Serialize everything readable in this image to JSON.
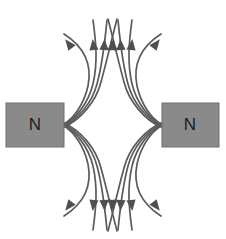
{
  "figure": {
    "width": 226,
    "height": 239,
    "background_color": "#ffffff"
  },
  "magnets": [
    {
      "id": "left-magnet",
      "label": "N",
      "pole": "north",
      "fill_color": "#8a8a8a",
      "stroke_color": "#6f6f6f",
      "label_color": "#1d1d1d",
      "x": 6,
      "y": 103,
      "width": 58,
      "height": 44,
      "label_x": 35,
      "label_y": 126
    },
    {
      "id": "right-magnet",
      "label": "N",
      "pole": "north",
      "fill_color": "#8a8a8a",
      "stroke_color": "#6f6f6f",
      "label_color": "#1d1d1d",
      "x": 162,
      "y": 103,
      "width": 57,
      "height": 44,
      "label_x": 190,
      "label_y": 126
    }
  ],
  "field": {
    "line_color": "#5b5b5b",
    "arrow_color": "#4f4f4f",
    "line_width": 1.7,
    "lines": [
      {
        "id": "L-up-1",
        "side": "left",
        "direction": "up",
        "d": "M 64 124 C 74 118 84 104 88 86 C 92 66 86 48 64 34"
      },
      {
        "id": "L-up-2",
        "side": "left",
        "direction": "up",
        "d": "M 64 125 C 76 118 88 104 93 84 C 98 62 96 42 93 20"
      },
      {
        "id": "L-up-3",
        "side": "left",
        "direction": "up",
        "d": "M 64 126 C 78 119 92 103 97 84 C 103 62 105 40 107 20"
      },
      {
        "id": "L-up-4",
        "side": "left",
        "direction": "up",
        "d": "M 64 127 C 80 120 96 102 101 82 C 107 60 112 38 117 19"
      },
      {
        "id": "L-dn-1",
        "side": "left",
        "direction": "down",
        "d": "M 64 126 C 74 132 84 146 88 164 C 92 184 86 202 64 216"
      },
      {
        "id": "L-dn-2",
        "side": "left",
        "direction": "down",
        "d": "M 64 125 C 76 132 88 146 93 166 C 98 188 96 208 93 230"
      },
      {
        "id": "L-dn-3",
        "side": "left",
        "direction": "down",
        "d": "M 64 124 C 78 131 92 147 97 166 C 103 188 105 210 107 230"
      },
      {
        "id": "L-dn-4",
        "side": "left",
        "direction": "down",
        "d": "M 64 123 C 80 130 96 148 101 168 C 107 190 112 212 117 231"
      },
      {
        "id": "R-up-1",
        "side": "right",
        "direction": "up",
        "d": "M 161 124 C 151 118 141 104 137 86 C 133 66 139 48 161 34"
      },
      {
        "id": "R-up-2",
        "side": "right",
        "direction": "up",
        "d": "M 161 125 C 149 118 137 104 132 84 C 127 62 129 42 132 20"
      },
      {
        "id": "R-up-3",
        "side": "right",
        "direction": "up",
        "d": "M 161 126 C 147 119 133 103 128 84 C 122 62 120 40 118 20"
      },
      {
        "id": "R-up-4",
        "side": "right",
        "direction": "up",
        "d": "M 161 127 C 145 120 129 102 124 82 C 118 60 113 38 108 19"
      },
      {
        "id": "R-dn-1",
        "side": "right",
        "direction": "down",
        "d": "M 161 126 C 151 132 141 146 137 164 C 133 184 139 202 161 216"
      },
      {
        "id": "R-dn-2",
        "side": "right",
        "direction": "down",
        "d": "M 161 125 C 149 132 137 146 132 166 C 127 188 129 208 132 230"
      },
      {
        "id": "R-dn-3",
        "side": "right",
        "direction": "down",
        "d": "M 161 124 C 147 131 133 147 128 166 C 122 188 120 210 118 230"
      },
      {
        "id": "R-dn-4",
        "side": "right",
        "direction": "down",
        "d": "M 161 123 C 145 130 129 148 124 168 C 118 190 113 212 108 231"
      }
    ],
    "arrows": [
      {
        "id": "A-up-L1",
        "direction": "up",
        "x": 72,
        "y": 48,
        "angle": -38
      },
      {
        "id": "A-up-L2",
        "direction": "up",
        "x": 94,
        "y": 50,
        "angle": -7
      },
      {
        "id": "A-up-L3",
        "direction": "up",
        "x": 104,
        "y": 50,
        "angle": 3
      },
      {
        "id": "A-up-L4",
        "direction": "up",
        "x": 112,
        "y": 50,
        "angle": 9
      },
      {
        "id": "A-up-R1",
        "direction": "up",
        "x": 153,
        "y": 48,
        "angle": 38
      },
      {
        "id": "A-up-R2",
        "direction": "up",
        "x": 131,
        "y": 50,
        "angle": 7
      },
      {
        "id": "A-up-R3",
        "direction": "up",
        "x": 121,
        "y": 50,
        "angle": -3
      },
      {
        "id": "A-up-R4",
        "direction": "up",
        "x": 113,
        "y": 50,
        "angle": -9
      },
      {
        "id": "A-dn-L1",
        "direction": "down",
        "x": 72,
        "y": 202,
        "angle": 38
      },
      {
        "id": "A-dn-L2",
        "direction": "down",
        "x": 94,
        "y": 200,
        "angle": 7
      },
      {
        "id": "A-dn-L3",
        "direction": "down",
        "x": 104,
        "y": 200,
        "angle": -3
      },
      {
        "id": "A-dn-L4",
        "direction": "down",
        "x": 112,
        "y": 200,
        "angle": -9
      },
      {
        "id": "A-dn-R1",
        "direction": "down",
        "x": 153,
        "y": 202,
        "angle": -38
      },
      {
        "id": "A-dn-R2",
        "direction": "down",
        "x": 131,
        "y": 200,
        "angle": -7
      },
      {
        "id": "A-dn-R3",
        "direction": "down",
        "x": 121,
        "y": 200,
        "angle": 3
      },
      {
        "id": "A-dn-R4",
        "direction": "down",
        "x": 113,
        "y": 200,
        "angle": 9
      }
    ]
  }
}
